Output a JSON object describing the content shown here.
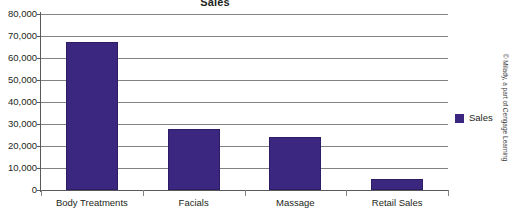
{
  "chart_data": {
    "type": "bar",
    "title": "Sales",
    "xlabel": "",
    "ylabel": "",
    "categories": [
      "Body Treatments",
      "Facials",
      "Massage",
      "Retail Sales"
    ],
    "series": [
      {
        "name": "Sales",
        "color": "#3B2680",
        "values": [
          67500,
          27800,
          24200,
          5200
        ]
      }
    ],
    "ylim": [
      0,
      80000
    ],
    "ytick_step": 10000,
    "ytick_labels": [
      "80,000",
      "70,000",
      "60,000",
      "50,000",
      "40,000",
      "30,000",
      "20,000",
      "10,000",
      "0"
    ],
    "ytick_values": [
      80000,
      70000,
      60000,
      50000,
      40000,
      30000,
      20000,
      10000,
      0
    ],
    "grid": "horizontal",
    "legend_position": "right",
    "legend_entries": [
      "Sales"
    ]
  },
  "legend": {
    "label": "Sales"
  },
  "attribution": {
    "text": "© Milady, a part of Cengage Learning"
  }
}
